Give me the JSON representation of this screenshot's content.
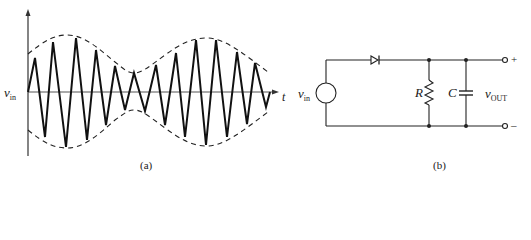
{
  "figure_a": {
    "caption": "(a)",
    "y_label_main": "v",
    "y_label_sub": "in",
    "x_label": "t",
    "description": "Amplitude-modulated triangular carrier with dashed envelope",
    "upper_peaks": [
      [
        35,
        58
      ],
      [
        53,
        42
      ],
      [
        76,
        38
      ],
      [
        96,
        50
      ],
      [
        115,
        66
      ],
      [
        134,
        73
      ],
      [
        156,
        65
      ],
      [
        176,
        53
      ],
      [
        196,
        40
      ],
      [
        216,
        40
      ],
      [
        237,
        52
      ],
      [
        255,
        63
      ]
    ],
    "lower_troughs": [
      [
        45,
        137
      ],
      [
        66,
        147
      ],
      [
        87,
        140
      ],
      [
        106,
        125
      ],
      [
        125,
        110
      ],
      [
        145,
        111
      ],
      [
        165,
        125
      ],
      [
        185,
        137
      ],
      [
        206,
        145
      ],
      [
        227,
        137
      ],
      [
        247,
        124
      ],
      [
        266,
        107
      ]
    ]
  },
  "figure_b": {
    "caption": "(b)",
    "source_label_main": "v",
    "source_label_sub": "in",
    "resistor_label": "R",
    "capacitor_label": "C",
    "output_label_main": "v",
    "output_label_sub": "OUT",
    "terminal_plus": "+",
    "terminal_minus": "–",
    "components": [
      "voltage-source",
      "diode",
      "resistor",
      "capacitor"
    ]
  }
}
